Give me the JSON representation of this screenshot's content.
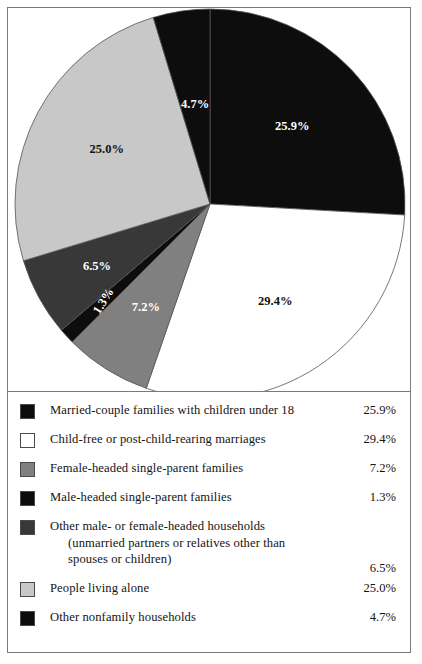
{
  "chart_data": {
    "type": "pie",
    "title": "",
    "subtitle": "",
    "xlabel": "",
    "ylabel": "",
    "legend_position": "bottom",
    "grid": false,
    "start_angle_deg": 0,
    "direction": "clockwise",
    "units": "percent",
    "categories": [
      "Married-couple families with children under 18",
      "Child-free or post-child-rearing marriages",
      "Female-headed single-parent families",
      "Male-headed single-parent families",
      "Other male- or female-headed households (unmarried partners or relatives other than spouses or children)",
      "People living alone",
      "Other nonfamily households"
    ],
    "values": [
      25.9,
      29.4,
      7.2,
      1.3,
      6.5,
      25.0,
      4.7
    ],
    "slice_labels": [
      "25.9%",
      "29.4%",
      "7.2%",
      "1.3%",
      "6.5%",
      "25.0%",
      "4.7%"
    ],
    "colors": [
      "#0d0d0d",
      "#ffffff",
      "#808080",
      "#0d0d0d",
      "#383838",
      "#c8c8c8",
      "#0d0d0d"
    ],
    "label_text_colors": [
      "#ffffff",
      "#111111",
      "#ffffff",
      "#ffffff",
      "#ffffff",
      "#111111",
      "#ffffff"
    ],
    "slices": [
      {
        "label": "25.9%",
        "value": 25.9,
        "color": "#0d0d0d",
        "label_color": "#ffffff",
        "start_pct": 0.0,
        "end_pct": 25.9
      },
      {
        "label": "29.4%",
        "value": 29.4,
        "color": "#ffffff",
        "label_color": "#111111",
        "start_pct": 25.9,
        "end_pct": 55.3
      },
      {
        "label": "7.2%",
        "value": 7.2,
        "color": "#808080",
        "label_color": "#ffffff",
        "start_pct": 55.3,
        "end_pct": 62.5
      },
      {
        "label": "1.3%",
        "value": 1.3,
        "color": "#0d0d0d",
        "label_color": "#ffffff",
        "start_pct": 62.5,
        "end_pct": 63.8
      },
      {
        "label": "6.5%",
        "value": 6.5,
        "color": "#383838",
        "label_color": "#ffffff",
        "start_pct": 63.8,
        "end_pct": 70.3
      },
      {
        "label": "25.0%",
        "value": 25.0,
        "color": "#c8c8c8",
        "label_color": "#111111",
        "start_pct": 70.3,
        "end_pct": 95.3
      },
      {
        "label": "4.7%",
        "value": 4.7,
        "color": "#0d0d0d",
        "label_color": "#ffffff",
        "start_pct": 95.3,
        "end_pct": 100.0
      }
    ]
  },
  "legend": {
    "rows": [
      {
        "label": "Married-couple families with children under 18",
        "value": "25.9%",
        "color": "#0d0d0d",
        "continuation": []
      },
      {
        "label": "Child-free or post-child-rearing marriages",
        "value": "29.4%",
        "color": "#ffffff",
        "continuation": []
      },
      {
        "label": "Female-headed single-parent families",
        "value": "7.2%",
        "color": "#808080",
        "continuation": []
      },
      {
        "label": "Male-headed single-parent families",
        "value": "1.3%",
        "color": "#0d0d0d",
        "continuation": []
      },
      {
        "label": "Other male- or female-headed households",
        "value": "6.5%",
        "color": "#383838",
        "continuation": [
          "(unmarried partners or relatives other than",
          "spouses or children)"
        ]
      },
      {
        "label": "People living alone",
        "value": "25.0%",
        "color": "#c8c8c8",
        "continuation": []
      },
      {
        "label": "Other nonfamily households",
        "value": "4.7%",
        "color": "#0d0d0d",
        "continuation": []
      }
    ]
  },
  "style": {
    "frame_border_color": "#7a7a7a",
    "background": "#ffffff",
    "pie_outline_color": "#555555"
  }
}
